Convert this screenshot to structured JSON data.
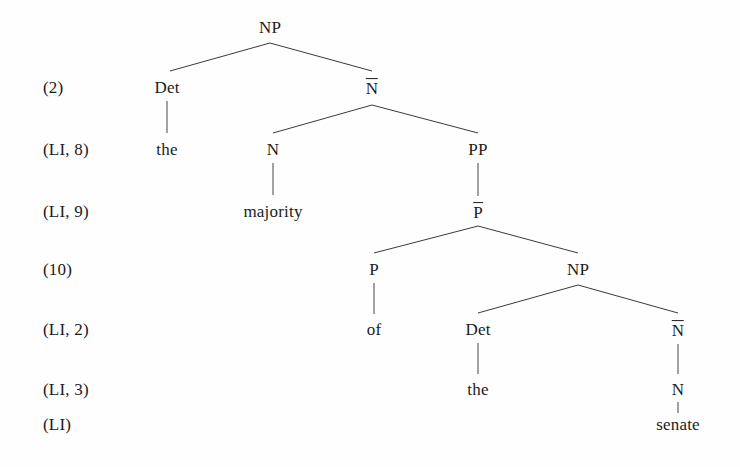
{
  "figure": {
    "kind": "syntax-tree",
    "background_color": "#fefefe",
    "text_color": "#1c1c1c",
    "line_color": "#3a3a3a"
  },
  "step_labels": [
    {
      "id": "step-2",
      "text": "(2)",
      "x": 43,
      "y": 88
    },
    {
      "id": "step-li8",
      "text": "(LI, 8)",
      "x": 43,
      "y": 150
    },
    {
      "id": "step-li9",
      "text": "(LI, 9)",
      "x": 43,
      "y": 212
    },
    {
      "id": "step-10",
      "text": "(10)",
      "x": 43,
      "y": 270
    },
    {
      "id": "step-li2",
      "text": "(LI, 2)",
      "x": 43,
      "y": 330
    },
    {
      "id": "step-li3",
      "text": "(LI, 3)",
      "x": 43,
      "y": 390
    },
    {
      "id": "step-li",
      "text": "(LI)",
      "x": 43,
      "y": 425
    }
  ],
  "nodes": [
    {
      "id": "np-root",
      "label": "NP",
      "type": "category",
      "bar": false,
      "x": 270,
      "y": 28
    },
    {
      "id": "det-1",
      "label": "Det",
      "type": "category",
      "bar": false,
      "x": 167,
      "y": 88
    },
    {
      "id": "nbar-1",
      "label": "N",
      "type": "category",
      "bar": true,
      "x": 372,
      "y": 88
    },
    {
      "id": "the-1",
      "label": "the",
      "type": "terminal",
      "bar": false,
      "x": 167,
      "y": 150
    },
    {
      "id": "n-1",
      "label": "N",
      "type": "category",
      "bar": false,
      "x": 273,
      "y": 150
    },
    {
      "id": "pp-1",
      "label": "PP",
      "type": "category",
      "bar": false,
      "x": 478,
      "y": 150
    },
    {
      "id": "majority",
      "label": "majority",
      "type": "terminal",
      "bar": false,
      "x": 273,
      "y": 212
    },
    {
      "id": "pbar-1",
      "label": "P",
      "type": "category",
      "bar": true,
      "x": 478,
      "y": 212
    },
    {
      "id": "p-1",
      "label": "P",
      "type": "category",
      "bar": false,
      "x": 374,
      "y": 270
    },
    {
      "id": "np-2",
      "label": "NP",
      "type": "category",
      "bar": false,
      "x": 578,
      "y": 270
    },
    {
      "id": "of-1",
      "label": "of",
      "type": "terminal",
      "bar": false,
      "x": 374,
      "y": 330
    },
    {
      "id": "det-2",
      "label": "Det",
      "type": "category",
      "bar": false,
      "x": 478,
      "y": 330
    },
    {
      "id": "nbar-2",
      "label": "N",
      "type": "category",
      "bar": true,
      "x": 678,
      "y": 330
    },
    {
      "id": "the-2",
      "label": "the",
      "type": "terminal",
      "bar": false,
      "x": 478,
      "y": 390
    },
    {
      "id": "n-2",
      "label": "N",
      "type": "category",
      "bar": false,
      "x": 678,
      "y": 390
    },
    {
      "id": "senate",
      "label": "senate",
      "type": "terminal",
      "bar": false,
      "x": 678,
      "y": 425
    }
  ],
  "edges": [
    {
      "id": "e-np-det",
      "kind": "branch",
      "x1": 270,
      "y1": 43,
      "x2": 170,
      "y2": 71
    },
    {
      "id": "e-np-nbar",
      "kind": "branch",
      "x1": 270,
      "y1": 43,
      "x2": 372,
      "y2": 71
    },
    {
      "id": "e-det-the",
      "kind": "stem",
      "x1": 167,
      "y1": 101,
      "x2": 167,
      "y2": 133
    },
    {
      "id": "e-nbar-n",
      "kind": "branch",
      "x1": 372,
      "y1": 105,
      "x2": 273,
      "y2": 133
    },
    {
      "id": "e-nbar-pp",
      "kind": "branch",
      "x1": 372,
      "y1": 105,
      "x2": 478,
      "y2": 133
    },
    {
      "id": "e-n-majority",
      "kind": "stem",
      "x1": 273,
      "y1": 163,
      "x2": 273,
      "y2": 195
    },
    {
      "id": "e-pp-pbar",
      "kind": "stem",
      "x1": 478,
      "y1": 163,
      "x2": 478,
      "y2": 196
    },
    {
      "id": "e-pbar-p",
      "kind": "branch",
      "x1": 478,
      "y1": 226,
      "x2": 374,
      "y2": 253
    },
    {
      "id": "e-pbar-np",
      "kind": "branch",
      "x1": 478,
      "y1": 226,
      "x2": 578,
      "y2": 253
    },
    {
      "id": "e-p-of",
      "kind": "stem",
      "x1": 374,
      "y1": 283,
      "x2": 374,
      "y2": 314
    },
    {
      "id": "e-np2-det",
      "kind": "branch",
      "x1": 578,
      "y1": 285,
      "x2": 478,
      "y2": 313
    },
    {
      "id": "e-np2-nbar",
      "kind": "branch",
      "x1": 578,
      "y1": 285,
      "x2": 678,
      "y2": 313
    },
    {
      "id": "e-det2-the",
      "kind": "stem",
      "x1": 478,
      "y1": 343,
      "x2": 478,
      "y2": 374
    },
    {
      "id": "e-nbar2-n",
      "kind": "stem",
      "x1": 678,
      "y1": 344,
      "x2": 678,
      "y2": 374
    },
    {
      "id": "e-n2-senate",
      "kind": "stem",
      "x1": 678,
      "y1": 402,
      "x2": 678,
      "y2": 413
    }
  ]
}
